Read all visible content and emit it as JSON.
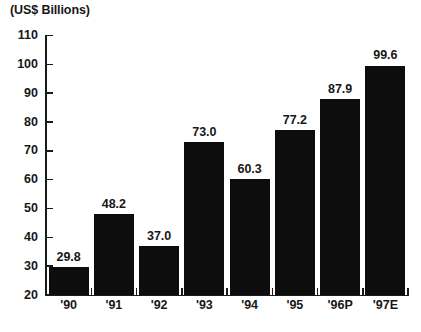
{
  "chart_data": {
    "type": "bar",
    "title": "(US$ Billions)",
    "xlabel": "",
    "ylabel": "",
    "categories": [
      "'90",
      "'91",
      "'92",
      "'93",
      "'94",
      "'95",
      "'96P",
      "'97E"
    ],
    "values": [
      29.8,
      48.2,
      37.0,
      73.0,
      60.3,
      77.2,
      87.9,
      99.6
    ],
    "value_labels": [
      "29.8",
      "48.2",
      "37.0",
      "73.0",
      "60.3",
      "77.2",
      "87.9",
      "99.6"
    ],
    "ylim": [
      20,
      110
    ],
    "ytick_labels": [
      "20",
      "30",
      "40",
      "50",
      "60",
      "70",
      "80",
      "90",
      "100",
      "110"
    ],
    "ytick_values": [
      20,
      30,
      40,
      50,
      60,
      70,
      80,
      90,
      100,
      110
    ],
    "grid": false,
    "legend": null,
    "bar_color": "#0d0d0d",
    "axis_color": "#1a1a1a",
    "text_color": "#171717",
    "background_color": "#ffffff"
  },
  "footer": {
    "ghost_text": ""
  }
}
